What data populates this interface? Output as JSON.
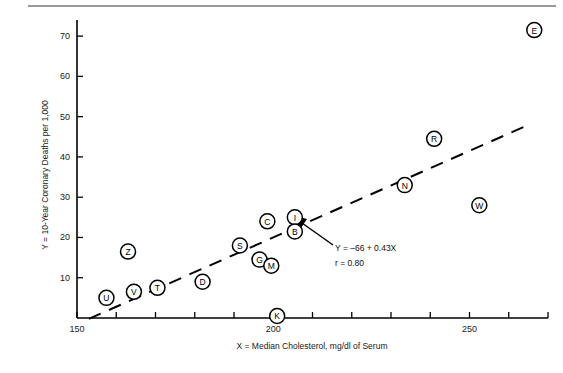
{
  "chart_data": {
    "type": "scatter",
    "title": "",
    "xlabel": "X = Median Cholesterol, mg/dl of Serum",
    "ylabel": "Y = 10-Year Coronary Deaths per 1,000",
    "xlim": [
      150,
      270
    ],
    "ylim": [
      0,
      74
    ],
    "xticks": [
      150,
      200,
      250
    ],
    "xtick_labels": [
      "150",
      "200",
      "250"
    ],
    "xtick_minor_step": 10,
    "yticks": [
      10,
      20,
      30,
      40,
      50,
      60,
      70
    ],
    "ytick_labels": [
      "10",
      "20",
      "30",
      "40",
      "50",
      "60",
      "70"
    ],
    "grid": false,
    "legend": "none",
    "marker": "circled-letter",
    "points": [
      {
        "label": "U",
        "x": 157.5,
        "y": 5.0
      },
      {
        "label": "V",
        "x": 164.5,
        "y": 6.5
      },
      {
        "label": "T",
        "x": 170.5,
        "y": 7.5
      },
      {
        "label": "Z",
        "x": 163.0,
        "y": 16.5
      },
      {
        "label": "D",
        "x": 182.0,
        "y": 9.0
      },
      {
        "label": "K",
        "x": 201.0,
        "y": 0.5
      },
      {
        "label": "S",
        "x": 191.5,
        "y": 18.0
      },
      {
        "label": "G",
        "x": 196.5,
        "y": 14.5
      },
      {
        "label": "M",
        "x": 199.5,
        "y": 13.0
      },
      {
        "label": "C",
        "x": 198.5,
        "y": 24.0
      },
      {
        "label": "I",
        "x": 205.5,
        "y": 25.0
      },
      {
        "label": "B",
        "x": 205.5,
        "y": 21.5
      },
      {
        "label": "N",
        "x": 233.5,
        "y": 33.0
      },
      {
        "label": "R",
        "x": 241.0,
        "y": 44.5
      },
      {
        "label": "W",
        "x": 252.5,
        "y": 28.0
      },
      {
        "label": "E",
        "x": 266.5,
        "y": 71.5
      }
    ],
    "trendline": {
      "equation": "Y = –66 + 0.43X",
      "correlation": "r = 0.80",
      "slope": 0.43,
      "intercept": -66,
      "style": "dashed",
      "x_start": 153.0,
      "x_end": 264.0
    },
    "annotations": [
      {
        "name": "regression-equation",
        "text": "Y = –66 + 0.43X"
      },
      {
        "name": "correlation-value",
        "text": "r = 0.80"
      }
    ]
  }
}
